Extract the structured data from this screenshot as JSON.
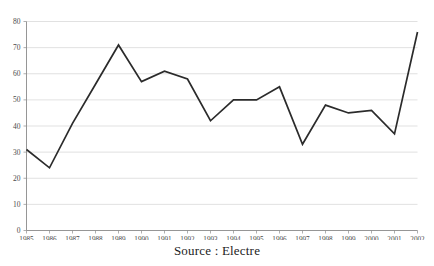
{
  "figure": {
    "title_remnant": "",
    "background_color": "#ffffff",
    "line_color": "#2b2b2b",
    "grid_color": "#d9d9d9",
    "axis_color": "#8a8a8a"
  },
  "caption": {
    "source_text": "Source : Electre"
  },
  "chart_data": {
    "type": "line",
    "title": "",
    "subtitle": "",
    "xlabel": "",
    "ylabel": "",
    "categories": [
      "1985",
      "1986",
      "1987",
      "1988",
      "1989",
      "1990",
      "1991",
      "1992",
      "1993",
      "1994",
      "1995",
      "1996",
      "1997",
      "1998",
      "1999",
      "2000",
      "2001",
      "2002"
    ],
    "values": [
      31,
      24,
      41,
      56,
      71,
      57,
      61,
      58,
      42,
      50,
      50,
      55,
      33,
      48,
      45,
      46,
      37,
      76
    ],
    "series": [
      {
        "name": "",
        "values": [
          31,
          24,
          41,
          56,
          71,
          57,
          61,
          58,
          42,
          50,
          50,
          55,
          33,
          48,
          45,
          46,
          37,
          76
        ]
      }
    ],
    "ylim": [
      0,
      80
    ],
    "yticks": [
      0,
      10,
      20,
      30,
      40,
      50,
      60,
      70,
      80
    ],
    "ytick_labels": [
      "0",
      "10",
      "20",
      "30",
      "40",
      "50",
      "60",
      "70",
      "80"
    ],
    "xtick_labels": [
      "1985",
      "1986",
      "1987",
      "1988",
      "1989",
      "1990",
      "1991",
      "1992",
      "1993",
      "1994",
      "1995",
      "1996",
      "1997",
      "1998",
      "1999",
      "2000",
      "2001",
      "2002"
    ],
    "grid": "horizontal",
    "legend": "none",
    "markers": "none"
  }
}
